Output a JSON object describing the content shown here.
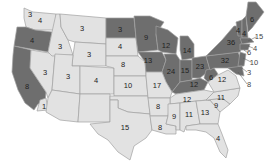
{
  "map": {
    "colors": {
      "dark": "#6e6e6e",
      "light": "#e2e2e2",
      "border": "#a0a0a0"
    },
    "states": [
      {
        "id": "WA",
        "value": "4",
        "shade": "light",
        "x": 40,
        "y": 21
      },
      {
        "id": "WA-small",
        "value": "3",
        "shade": "light",
        "x": 30,
        "y": 15
      },
      {
        "id": "OR",
        "value": "4",
        "shade": "dark",
        "x": 32,
        "y": 41
      },
      {
        "id": "CA",
        "value": "8",
        "shade": "dark",
        "x": 27,
        "y": 87
      },
      {
        "id": "CA-south",
        "value": "1",
        "shade": "light",
        "x": 44,
        "y": 107
      },
      {
        "id": "ID",
        "value": "3",
        "shade": "light",
        "x": 60,
        "y": 47
      },
      {
        "id": "NV",
        "value": "3",
        "shade": "light",
        "x": 45,
        "y": 73
      },
      {
        "id": "MT",
        "value": "3",
        "shade": "light",
        "x": 82,
        "y": 29
      },
      {
        "id": "WY",
        "value": "3",
        "shade": "light",
        "x": 89,
        "y": 55
      },
      {
        "id": "UT",
        "value": "3",
        "shade": "light",
        "x": 68,
        "y": 77
      },
      {
        "id": "CO",
        "value": "4",
        "shade": "light",
        "x": 96,
        "y": 81
      },
      {
        "id": "ND",
        "value": "3",
        "shade": "dark",
        "x": 120,
        "y": 30
      },
      {
        "id": "SD",
        "value": "4",
        "shade": "light",
        "x": 120,
        "y": 47
      },
      {
        "id": "NE",
        "value": "8",
        "shade": "light",
        "x": 123,
        "y": 65
      },
      {
        "id": "KS",
        "value": "10",
        "shade": "light",
        "x": 128,
        "y": 86
      },
      {
        "id": "TX",
        "value": "15",
        "shade": "light",
        "x": 125,
        "y": 128
      },
      {
        "id": "MN",
        "value": "9",
        "shade": "dark",
        "x": 146,
        "y": 38
      },
      {
        "id": "IA",
        "value": "13",
        "shade": "dark",
        "x": 148,
        "y": 61
      },
      {
        "id": "MO",
        "value": "17",
        "shade": "light",
        "x": 157,
        "y": 86
      },
      {
        "id": "AR",
        "value": "8",
        "shade": "light",
        "x": 158,
        "y": 107
      },
      {
        "id": "LA",
        "value": "8",
        "shade": "light",
        "x": 160,
        "y": 128
      },
      {
        "id": "WI",
        "value": "12",
        "shade": "dark",
        "x": 166,
        "y": 46
      },
      {
        "id": "IL",
        "value": "24",
        "shade": "dark",
        "x": 171,
        "y": 72
      },
      {
        "id": "MI",
        "value": "14",
        "shade": "dark",
        "x": 187,
        "y": 51
      },
      {
        "id": "IN",
        "value": "15",
        "shade": "dark",
        "x": 185,
        "y": 71
      },
      {
        "id": "KY",
        "value": "12",
        "shade": "dark",
        "x": 194,
        "y": 85
      },
      {
        "id": "TN",
        "value": "12",
        "shade": "light",
        "x": 187,
        "y": 100
      },
      {
        "id": "MS",
        "value": "9",
        "shade": "light",
        "x": 174,
        "y": 117
      },
      {
        "id": "AL",
        "value": "11",
        "shade": "light",
        "x": 189,
        "y": 115
      },
      {
        "id": "GA",
        "value": "13",
        "shade": "light",
        "x": 205,
        "y": 113
      },
      {
        "id": "FL",
        "value": "4",
        "shade": "light",
        "x": 218,
        "y": 139
      },
      {
        "id": "OH",
        "value": "23",
        "shade": "dark",
        "x": 200,
        "y": 67
      },
      {
        "id": "WV",
        "value": "6",
        "shade": "dark",
        "x": 211,
        "y": 78
      },
      {
        "id": "VA",
        "value": "12",
        "shade": "light",
        "x": 222,
        "y": 80
      },
      {
        "id": "NC",
        "value": "11",
        "shade": "light",
        "x": 221,
        "y": 98
      },
      {
        "id": "SC",
        "value": "9",
        "shade": "light",
        "x": 216,
        "y": 106
      },
      {
        "id": "PA",
        "value": "32",
        "shade": "dark",
        "x": 225,
        "y": 61
      },
      {
        "id": "NY",
        "value": "36",
        "shade": "dark",
        "x": 231,
        "y": 43
      },
      {
        "id": "VT",
        "value": "4",
        "shade": "dark",
        "x": 238,
        "y": 31
      },
      {
        "id": "NH",
        "value": "4",
        "shade": "dark",
        "x": 244,
        "y": 34
      },
      {
        "id": "ME",
        "value": "6",
        "shade": "dark",
        "x": 252,
        "y": 20
      }
    ],
    "external_labels": [
      {
        "id": "MA",
        "value": "15",
        "x": 259,
        "y": 37
      },
      {
        "id": "RI",
        "value": "4",
        "x": 255,
        "y": 49
      },
      {
        "id": "CT",
        "value": "6",
        "x": 249,
        "y": 53
      },
      {
        "id": "NJ",
        "value": "10",
        "x": 254,
        "y": 63
      },
      {
        "id": "DE",
        "value": "3",
        "x": 249,
        "y": 73
      },
      {
        "id": "MD",
        "value": "8",
        "x": 249,
        "y": 85
      }
    ]
  }
}
